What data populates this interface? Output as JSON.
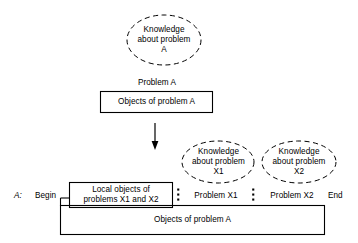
{
  "diagram": {
    "title_text_blocks": {
      "knowledge_a": "Knowledge\nabout problem\nA",
      "knowledge_a_line1": "Knowledge",
      "knowledge_a_line2": "about problem",
      "knowledge_a_line3": "A",
      "knowledge_x1_line1": "Knowledge",
      "knowledge_x1_line2": "about problem",
      "knowledge_x1_line3": "X1",
      "knowledge_x2_line1": "Knowledge",
      "knowledge_x2_line2": "about problem",
      "knowledge_x2_line3": "X2"
    },
    "labels": {
      "problem_a": "Problem A",
      "objects_of_problem_a_top": "Objects of problem A",
      "objects_of_problem_a_bottom": "Objects of problem A",
      "local_objects_line1": "Local objects of",
      "local_objects_line2": "problems X1 and X2",
      "procedure_name": "A:",
      "begin": "Begin",
      "end": "End",
      "problem_x1": "Problem X1",
      "problem_x2": "Problem X2",
      "separator_1": ":",
      "separator_2": ":"
    },
    "colors": {
      "stroke": "#000000",
      "text": "#000000",
      "background": "#ffffff"
    },
    "shapes": {
      "ellipse_knowledge_a": "dashed-ellipse",
      "ellipse_knowledge_x1": "dashed-ellipse",
      "ellipse_knowledge_x2": "dashed-ellipse",
      "box_objects_a_top": "rectangle",
      "box_local_objects": "rectangle",
      "box_objects_a_bottom": "rectangle",
      "arrow_down": "down-arrow"
    }
  }
}
